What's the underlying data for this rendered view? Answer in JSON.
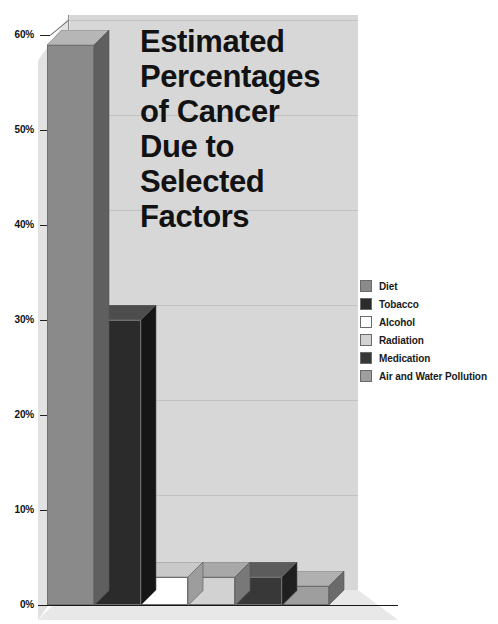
{
  "chart_data": {
    "type": "bar",
    "title_lines": [
      "Estimated",
      "Percentages",
      "of Cancer",
      "Due to",
      "Selected",
      "Factors"
    ],
    "xlabel": "",
    "ylabel": "",
    "categories": [
      "Diet",
      "Tobacco",
      "Alcohol",
      "Radiation",
      "Medication",
      "Air and Water Pollution"
    ],
    "values": [
      59,
      30,
      3,
      3,
      3,
      2
    ],
    "ylim": [
      0,
      60
    ],
    "ytick_labels": [
      "0%",
      "10%",
      "20%",
      "30%",
      "40%",
      "50%",
      "60%"
    ],
    "ytick_values": [
      0,
      10,
      20,
      30,
      40,
      50,
      60
    ],
    "grid": true,
    "legend_position": "right",
    "projection": "3d",
    "series": [
      {
        "name": "Estimated Percentage of Cancer",
        "values": [
          59,
          30,
          3,
          3,
          3,
          2
        ]
      }
    ],
    "bars": [
      {
        "label": "Diet",
        "value": 59,
        "front": "#8a8a8a",
        "top": "#b6b6b6",
        "side": "#5f5f5f"
      },
      {
        "label": "Tobacco",
        "value": 30,
        "front": "#2b2b2b",
        "top": "#4d4d4d",
        "side": "#161616"
      },
      {
        "label": "Alcohol",
        "value": 3,
        "front": "#ffffff",
        "top": "#c9c9c9",
        "side": "#9d9d9d"
      },
      {
        "label": "Radiation",
        "value": 3,
        "front": "#d2d2d2",
        "top": "#a8a8a8",
        "side": "#787878"
      },
      {
        "label": "Medication",
        "value": 3,
        "front": "#383838",
        "top": "#5c5c5c",
        "side": "#1f1f1f"
      },
      {
        "label": "Air and Water Pollution",
        "value": 2,
        "front": "#9e9e9e",
        "top": "#b0b0b0",
        "side": "#6b6b6b"
      }
    ],
    "colors": {
      "diet": "#8a8a8a",
      "tobacco": "#2b2b2b",
      "alcohol": "#ffffff",
      "radiation": "#d2d2d2",
      "medication": "#383838",
      "air_and_water_pollution": "#9e9e9e",
      "back_wall": "#d7d7d7",
      "left_wall": "#e2e2e2",
      "floor": "#e8e8e8",
      "text": "#121212"
    }
  },
  "legend": {
    "items": [
      {
        "label": "Diet",
        "swatch": "#8a8a8a"
      },
      {
        "label": "Tobacco",
        "swatch": "#2b2b2b"
      },
      {
        "label": "Alcohol",
        "swatch": "#ffffff"
      },
      {
        "label": "Radiation",
        "swatch": "#d2d2d2"
      },
      {
        "label": "Medication",
        "swatch": "#383838"
      },
      {
        "label": "Air and Water Pollution",
        "swatch": "#9e9e9e"
      }
    ]
  },
  "axis": {
    "y_ticks": [
      {
        "label": "60%",
        "value": 60
      },
      {
        "label": "50%",
        "value": 50
      },
      {
        "label": "40%",
        "value": 40
      },
      {
        "label": "30%",
        "value": 30
      },
      {
        "label": "20%",
        "value": 20
      },
      {
        "label": "10%",
        "value": 10
      },
      {
        "label": "0%",
        "value": 0
      }
    ]
  }
}
